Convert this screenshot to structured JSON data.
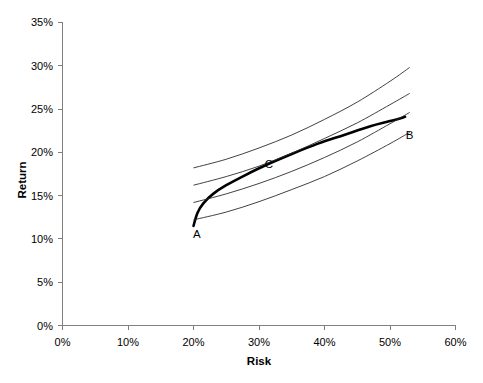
{
  "chart_data": {
    "type": "line",
    "title": "",
    "xlabel": "Risk",
    "ylabel": "Return",
    "xlim": [
      0,
      60
    ],
    "ylim": [
      0,
      35
    ],
    "xticks": [
      "0%",
      "10%",
      "20%",
      "30%",
      "40%",
      "50%",
      "60%"
    ],
    "xtick_values": [
      0,
      10,
      20,
      30,
      40,
      50,
      60
    ],
    "yticks": [
      "0%",
      "5%",
      "10%",
      "15%",
      "20%",
      "25%",
      "30%",
      "35%"
    ],
    "ytick_values": [
      0,
      5,
      10,
      15,
      20,
      25,
      30,
      35
    ],
    "grid": false,
    "legend": "none",
    "series": [
      {
        "name": "efficient-frontier",
        "style": "thick",
        "color": "#000000",
        "points": [
          [
            20.0,
            11.5
          ],
          [
            20.6,
            13.0
          ],
          [
            21.5,
            14.1
          ],
          [
            23.0,
            15.2
          ],
          [
            25.0,
            16.2
          ],
          [
            28.0,
            17.4
          ],
          [
            31.0,
            18.5
          ],
          [
            35.0,
            19.8
          ],
          [
            39.0,
            21.0
          ],
          [
            43.0,
            22.0
          ],
          [
            47.0,
            23.0
          ],
          [
            50.0,
            23.6
          ],
          [
            52.3,
            24.1
          ]
        ]
      },
      {
        "name": "indifference-curve-1",
        "style": "thin",
        "color": "#2b2b2b",
        "points": [
          [
            20.0,
            12.2
          ],
          [
            25.0,
            13.1
          ],
          [
            30.0,
            14.3
          ],
          [
            35.0,
            15.7
          ],
          [
            40.0,
            17.2
          ],
          [
            45.0,
            19.0
          ],
          [
            50.0,
            21.0
          ],
          [
            53.0,
            22.3
          ]
        ]
      },
      {
        "name": "indifference-curve-2",
        "style": "thin",
        "color": "#2b2b2b",
        "points": [
          [
            20.0,
            14.2
          ],
          [
            25.0,
            15.2
          ],
          [
            30.0,
            16.4
          ],
          [
            35.0,
            17.8
          ],
          [
            40.0,
            19.4
          ],
          [
            45.0,
            21.2
          ],
          [
            50.0,
            23.3
          ],
          [
            53.0,
            24.6
          ]
        ]
      },
      {
        "name": "indifference-curve-3",
        "style": "thin",
        "color": "#2b2b2b",
        "points": [
          [
            20.0,
            16.2
          ],
          [
            25.0,
            17.2
          ],
          [
            30.0,
            18.4
          ],
          [
            35.0,
            19.9
          ],
          [
            40.0,
            21.6
          ],
          [
            45.0,
            23.4
          ],
          [
            50.0,
            25.5
          ],
          [
            53.0,
            26.8
          ]
        ]
      },
      {
        "name": "indifference-curve-4",
        "style": "thin",
        "color": "#2b2b2b",
        "points": [
          [
            20.0,
            18.2
          ],
          [
            25.0,
            19.2
          ],
          [
            30.0,
            20.5
          ],
          [
            35.0,
            22.0
          ],
          [
            40.0,
            23.8
          ],
          [
            45.0,
            25.8
          ],
          [
            50.0,
            28.2
          ],
          [
            53.0,
            29.8
          ]
        ]
      }
    ],
    "annotations": [
      {
        "label": "A",
        "x": 20.5,
        "y": 10.1,
        "describes": "left endpoint of efficient frontier"
      },
      {
        "label": "B",
        "x": 53.0,
        "y": 21.5,
        "describes": "right endpoint of efficient frontier"
      },
      {
        "label": "C",
        "x": 31.5,
        "y": 18.2,
        "describes": "tangency point of frontier with indifference curve"
      }
    ]
  }
}
